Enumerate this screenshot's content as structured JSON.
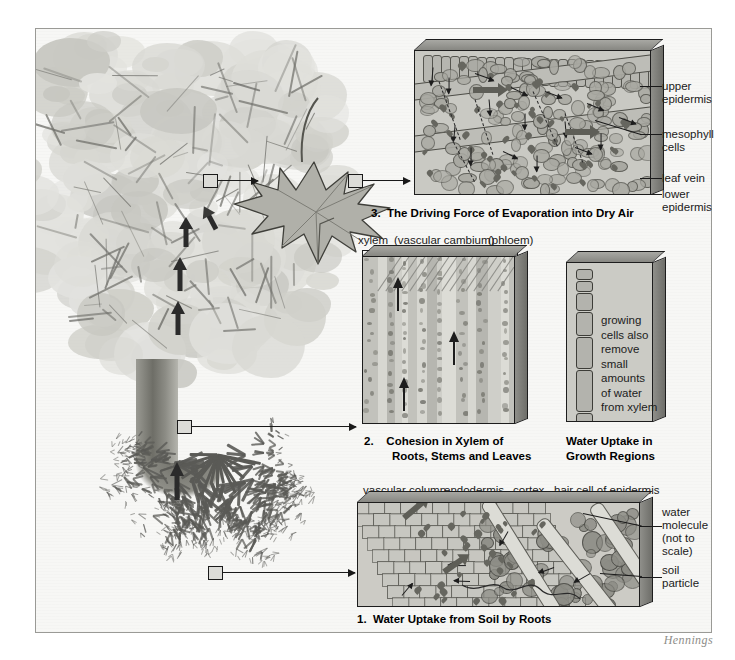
{
  "figure": {
    "signature": "Hennings",
    "background_color": "#f7f7f5",
    "frame_color": "#9a9a96"
  },
  "panels": [
    {
      "id": "leaf",
      "number": "3.",
      "caption": "3.  The Driving Force of Evaporation into Dry Air",
      "labels": [
        {
          "text": "upper\nepidermis"
        },
        {
          "text": "mesophyll\ncells"
        },
        {
          "text": "leaf vein"
        },
        {
          "text": "lower\nepidermis"
        }
      ]
    },
    {
      "id": "stem",
      "number": "2.",
      "caption_line1": "2.    Cohesion in Xylem of",
      "caption_line2": "Roots, Stems and Leaves",
      "top_labels": [
        "xylem",
        "(vascular cambium)",
        "(phloem)"
      ]
    },
    {
      "id": "growth",
      "caption_line1": "Water Uptake in",
      "caption_line2": "Growth Regions",
      "body_text": "growing\ncells also\nremove\nsmall\namounts\nof water\nfrom xylem"
    },
    {
      "id": "root",
      "number": "1.",
      "caption": "1.  Water Uptake from Soil by Roots",
      "top_labels": [
        "vascular column",
        "endodermis",
        "cortex",
        "hair cell of epidermis"
      ],
      "right_labels": [
        {
          "text": "water\nmolecule\n(not to\nscale)"
        },
        {
          "text": "soil\nparticle"
        }
      ]
    }
  ]
}
